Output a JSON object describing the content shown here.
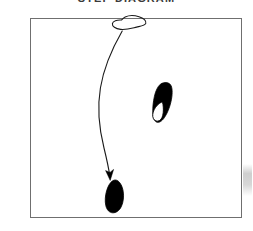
{
  "page": {
    "width": 253,
    "height": 231,
    "background_color": "#ffffff",
    "title": "STEP DIAGRAM"
  },
  "frame": {
    "name": "diagram-border",
    "x": 30,
    "y": 18,
    "width": 212,
    "height": 200,
    "stroke_color": "#6f6f6f",
    "fill_color": "#ffffff"
  },
  "shapes": [
    {
      "id": "top-outline-blob",
      "label": "outlined amoeba shape",
      "fill": "none",
      "stroke": "#1a1a1a",
      "stroke_width": 1.1,
      "bbox": [
        112,
        15,
        34,
        15
      ],
      "path": "M 121.5 20.0 C 117.0 19.6 112.8 21.2 112.4 23.6 C 112.0 26.3 115.4 28.8 120.6 29.4 C 126.2 30.1 131.6 28.3 136.6 27.1 C 140.8 26.1 145.0 25.6 145.8 23.4 C 146.7 21.0 143.6 18.1 139.0 16.7 C 134.2 15.2 128.6 15.4 125.2 17.0 C 123.2 17.9 122.6 19.1 121.5 20.0 Z"
    },
    {
      "id": "right-filled-blob",
      "label": "filled teardrop with white inner loop",
      "fill": "#000000",
      "stroke": "#000000",
      "stroke_width": 0.8,
      "bbox": [
        151,
        83,
        22,
        40
      ],
      "path": "M 160.4 84.2 C 157.6 86.6 155.6 91.0 154.4 96.4 C 153.2 101.8 152.6 107.6 152.8 112.4 C 153.0 117.2 154.2 120.8 156.4 122.0 C 158.8 123.2 161.8 121.4 164.4 117.6 C 167.2 113.6 169.6 107.8 171.0 101.6 C 172.4 95.4 172.6 89.2 171.2 86.0 C 169.8 82.8 166.6 82.2 163.8 82.8 C 162.2 83.1 161.2 83.5 160.4 84.2 Z"
    },
    {
      "id": "right-blob-inner-hole",
      "label": "white inner loop of right blob",
      "fill": "#ffffff",
      "stroke": "#000000",
      "stroke_width": 0.9,
      "bbox": [
        152,
        101,
        12,
        21
      ],
      "path": "M 161.4 102.2 C 158.4 103.6 155.8 106.4 154.2 109.6 C 152.6 112.8 152.2 116.2 153.4 118.6 C 154.6 121.0 157.2 121.8 159.4 120.6 C 161.6 119.4 162.8 116.4 163.2 112.8 C 163.6 109.0 163.2 104.8 162.6 102.8 C 162.3 102.2 161.9 102.0 161.4 102.2 Z"
    },
    {
      "id": "bottom-filled-blob",
      "label": "filled elongated oval",
      "fill": "#000000",
      "stroke": "#000000",
      "stroke_width": 0.8,
      "bbox": [
        105,
        180,
        19,
        33
      ],
      "path": "M 113.0 180.6 C 110.2 182.2 108.0 186.0 106.6 190.8 C 105.2 195.6 104.8 201.2 105.8 205.6 C 106.8 210.0 109.4 212.6 112.6 212.8 C 116.0 213.0 119.4 210.6 121.4 206.4 C 123.4 202.2 124.0 196.4 123.2 191.4 C 122.4 186.4 120.2 182.2 117.4 180.6 C 116.0 179.8 114.4 179.8 113.0 180.6 Z"
    }
  ],
  "arrow": {
    "id": "motion-arrow",
    "label": "curved motion arrow from top shape to bottom shape",
    "stroke": "#1a1a1a",
    "stroke_width": 1.1,
    "start": [
      122,
      31
    ],
    "end": [
      110,
      179
    ],
    "path": "M 122.2 31.0 C 113.0 47.0 104.0 66.0 100.4 88.0 C 97.4 106.0 99.0 128.0 104.0 148.0 C 106.6 158.6 108.8 169.0 110.0 177.0",
    "arrowhead": {
      "fill": "#000000",
      "path": "M 110.2 180.4 L 105.6 170.6 L 110.0 172.4 L 113.6 169.4 Z"
    }
  },
  "artifacts": [
    {
      "id": "edge-smudge",
      "label": "faint grey scan smudge at right edge",
      "color": "#c6c6c6"
    }
  ]
}
